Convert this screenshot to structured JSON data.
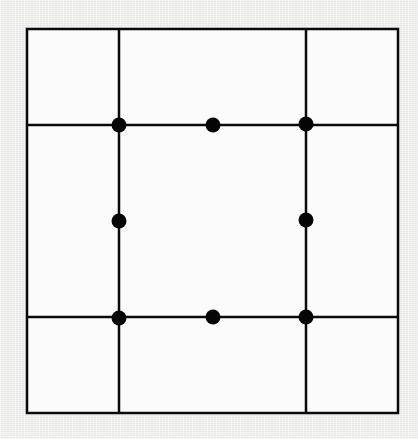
{
  "diagram": {
    "colors": {
      "line": "#0a0a0a",
      "dot": "#050505",
      "fill": "#fbfbfb",
      "background": "#f1f1f0"
    },
    "outer_square": {
      "x1": 27,
      "y1": 29,
      "x2": 398,
      "y2": 413
    },
    "vertical_lines": [
      {
        "x": 119
      },
      {
        "x": 306
      }
    ],
    "horizontal_lines": [
      {
        "y": 125
      },
      {
        "y": 317
      }
    ],
    "dot_radius": 7.5,
    "dots": [
      {
        "label": "inner-top-left",
        "x": 119,
        "y": 125
      },
      {
        "label": "inner-top-mid",
        "x": 213,
        "y": 125
      },
      {
        "label": "inner-top-right",
        "x": 306,
        "y": 124
      },
      {
        "label": "inner-mid-left",
        "x": 119,
        "y": 221
      },
      {
        "label": "inner-mid-right",
        "x": 306,
        "y": 220
      },
      {
        "label": "inner-bottom-left",
        "x": 119,
        "y": 318
      },
      {
        "label": "inner-bottom-mid",
        "x": 213,
        "y": 317
      },
      {
        "label": "inner-bottom-right",
        "x": 306,
        "y": 317
      }
    ]
  }
}
